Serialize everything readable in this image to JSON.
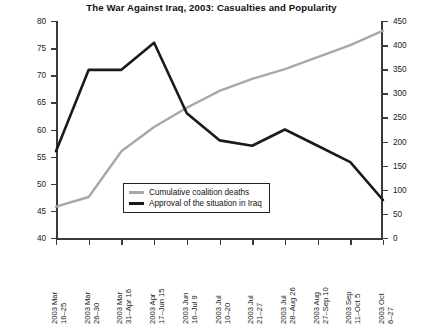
{
  "chart_data": {
    "type": "line",
    "title": "The War Against Iraq, 2003: Casualties and Popularity",
    "xlabel": "",
    "ylabel": "",
    "grid": false,
    "legend_position": "inside-center",
    "categories": [
      "2003 Mar\n16–25",
      "2003 Mar\n26–30",
      "2003 Mar\n31–Apr 16",
      "2003 Apr\n17–Jun 15",
      "2003 Jun\n16–Jul 9",
      "2003 Jul\n10–20",
      "2003 Jul\n21–27",
      "2003 Jul\n28–Aug 26",
      "2003 Aug\n27–Sep 10",
      "2003 Sep\n11–Oct 5",
      "2003 Oct\n6–27"
    ],
    "categories_lines": [
      [
        "2003 Mar",
        "16–25"
      ],
      [
        "2003 Mar",
        "26–30"
      ],
      [
        "2003 Mar",
        "31–Apr 16"
      ],
      [
        "2003 Apr",
        "17–Jun 15"
      ],
      [
        "2003 Jun",
        "16–Jul 9"
      ],
      [
        "2003 Jul",
        "10–20"
      ],
      [
        "2003 Jul",
        "21–27"
      ],
      [
        "2003 Jul",
        "28–Aug 26"
      ],
      [
        "2003 Aug",
        "27–Sep 10"
      ],
      [
        "2003 Sep",
        "11–Oct 5"
      ],
      [
        "2003 Oct",
        "6–27"
      ]
    ],
    "series": [
      {
        "name": "Cumulative coalition deaths",
        "axis": "right",
        "color": "#a8a8a8",
        "values": [
          65,
          85,
          180,
          230,
          270,
          305,
          330,
          350,
          375,
          400,
          430
        ]
      },
      {
        "name": "Approval of the situation in Iraq",
        "axis": "left",
        "color": "#1a1a1a",
        "values": [
          56,
          71,
          71,
          76,
          63,
          58,
          57,
          60,
          57,
          54,
          47
        ]
      }
    ],
    "y_left": {
      "min": 40,
      "max": 80,
      "step": 5,
      "ticks": [
        40,
        45,
        50,
        55,
        60,
        65,
        70,
        75,
        80
      ]
    },
    "y_right": {
      "min": 0,
      "max": 450,
      "step": 50,
      "ticks": [
        0,
        50,
        100,
        150,
        200,
        250,
        300,
        350,
        400,
        450
      ]
    }
  },
  "legend": {
    "items": [
      {
        "label": "Cumulative coalition deaths",
        "color": "#a8a8a8"
      },
      {
        "label": "Approval of the situation in Iraq",
        "color": "#1a1a1a"
      }
    ]
  }
}
